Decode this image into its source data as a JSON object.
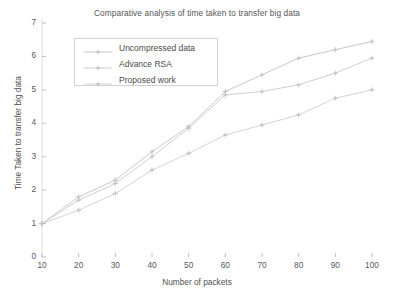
{
  "chart_data": {
    "type": "line",
    "title": "Comparative analysis of time taken to transfer big data",
    "xlabel": "Number of packets",
    "ylabel": "Time Taken to transfer big data",
    "x": [
      10,
      20,
      30,
      40,
      50,
      60,
      70,
      80,
      90,
      100
    ],
    "xtick_labels": [
      "10",
      "20",
      "30",
      "40",
      "50",
      "60",
      "70",
      "80",
      "90",
      "100"
    ],
    "ytick_labels": [
      "0",
      "1",
      "2",
      "3",
      "4",
      "5",
      "6",
      "7"
    ],
    "xlim": [
      10,
      100
    ],
    "ylim": [
      0,
      7
    ],
    "grid": false,
    "legend_position": "upper-left-inside",
    "marker": "plus-dot",
    "line_style": "solid-faint",
    "series": [
      {
        "name": "Uncompressed data",
        "color": "#c9c9c9",
        "values": [
          1.0,
          1.8,
          2.3,
          3.15,
          3.9,
          4.95,
          5.45,
          5.95,
          6.2,
          6.45
        ]
      },
      {
        "name": "Advance RSA",
        "color": "#cfcfcf",
        "values": [
          1.0,
          1.7,
          2.2,
          3.0,
          3.85,
          4.85,
          4.95,
          5.15,
          5.5,
          5.95
        ]
      },
      {
        "name": "Proposed work",
        "color": "#d4d4d4",
        "values": [
          1.0,
          1.4,
          1.9,
          2.6,
          3.1,
          3.65,
          3.95,
          4.25,
          4.75,
          5.0
        ]
      }
    ]
  },
  "axes": {
    "axis_color": "#d8d8d8",
    "tick_color": "#b8b8b8",
    "text_color": "#555555"
  }
}
